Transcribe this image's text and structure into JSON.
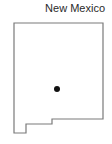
{
  "map": {
    "title": "New Mexico",
    "outline_color": "#7a7a7a",
    "marker_color": "#111111",
    "outline_points": "14,23 103,23 103,119 52,119 52,124 26,124 26,133 14,133",
    "marker": {
      "cx": "57",
      "cy": "89",
      "r": "3"
    }
  }
}
